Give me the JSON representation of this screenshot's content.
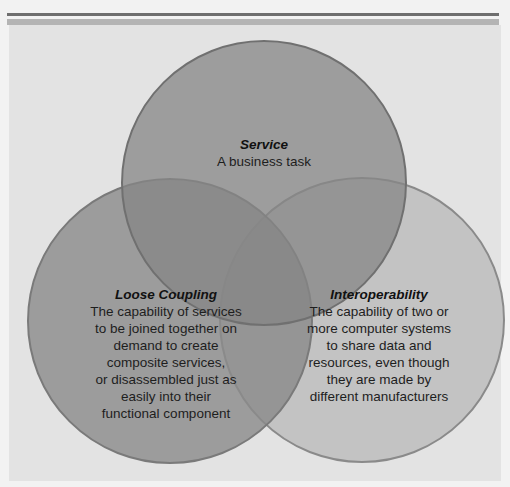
{
  "diagram": {
    "type": "venn",
    "colors": {
      "background": "#f2f2f2",
      "panel": "#e3e3e3",
      "rule_dark": "#6e6e6e",
      "rule_light": "#b4b4b4",
      "circle_service": "#8f8f8f",
      "circle_loose_coupling": "#9a9a9a",
      "circle_interoperability": "#c0c0c0",
      "circle_stroke": "#7a7a7a"
    },
    "circles": [
      {
        "id": "service",
        "title": "Service",
        "body": "A business task"
      },
      {
        "id": "loose_coupling",
        "title": "Loose Coupling",
        "body": "The capability of services\nto be joined together on\ndemand to create\ncomposite services,\nor disassembled just as\neasily into their\nfunctional component"
      },
      {
        "id": "interoperability",
        "title": "Interoperability",
        "body": "The capability of two or\nmore computer systems\nto share data and\nresources, even though\nthey are made by\ndifferent manufacturers"
      }
    ]
  }
}
